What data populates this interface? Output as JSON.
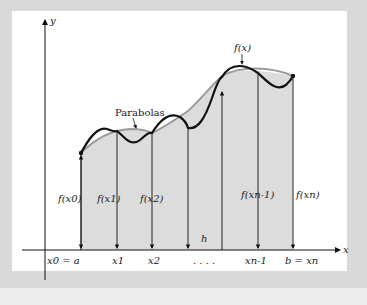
{
  "figure": {
    "axes": {
      "x_label": "x",
      "y_label": "y"
    },
    "curve_label": "f(x)",
    "parabola_label": "Parabolas",
    "interval_label": "h",
    "ellipsis": ". . . .",
    "x_ticks": [
      "x0 = a",
      "x1",
      "x2",
      "xn-1",
      "b = xn"
    ],
    "ordinates": [
      "f(x0)",
      "f(x1)",
      "f(x2)",
      "f(xn-1)",
      "f(xn)"
    ],
    "colors": {
      "background": "#d9d9d9",
      "panel": "#ffffff",
      "shade": "#dcdcdc",
      "curve": "#111111",
      "parabola": "#9a9a9a"
    }
  }
}
